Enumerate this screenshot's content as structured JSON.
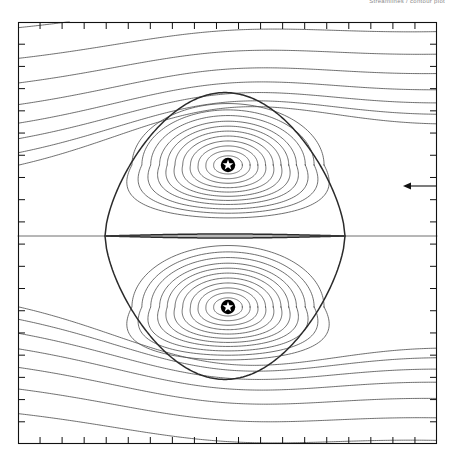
{
  "figure": {
    "top_note": "Streamlines / contour plot",
    "background": "#ffffff",
    "frame_color": "#111111",
    "line_color": "#4a4a4a",
    "separatrix_color": "#2b2b2b"
  },
  "axes": {
    "x_tick_count": 19,
    "y_tick_count": 19,
    "x_tick_labels": [],
    "y_tick_labels": [],
    "xlabel": "",
    "ylabel": "",
    "frame": {
      "left": 18,
      "top": 22,
      "right": 437,
      "bottom": 444
    }
  },
  "annotations": {
    "flow_arrow": {
      "name": "flow-direction-arrow",
      "direction": "left",
      "x_start": 437,
      "x_end": 403,
      "y": 186
    }
  },
  "chart_data": {
    "type": "line",
    "title": "",
    "subtitle": "",
    "xlabel": "",
    "ylabel": "",
    "xlim": [
      0,
      1
    ],
    "ylim": [
      0,
      1
    ],
    "grid": false,
    "legend": null,
    "critical_points": [
      {
        "type": "O-point",
        "label": "vortex-core-upper",
        "x": 228,
        "y": 165,
        "marker": "star-in-disc"
      },
      {
        "type": "O-point",
        "label": "vortex-core-lower",
        "x": 228,
        "y": 307,
        "marker": "star-in-disc"
      },
      {
        "type": "X-point",
        "label": "saddle-left",
        "x": 105,
        "y": 235,
        "marker": "none"
      },
      {
        "type": "X-point",
        "label": "saddle-right",
        "x": 345,
        "y": 235,
        "marker": "none"
      }
    ],
    "closed_contour_levels": [
      0.06,
      0.13,
      0.2,
      0.27,
      0.34,
      0.41,
      0.48,
      0.55,
      0.62,
      0.7,
      0.78,
      0.87
    ],
    "separatrix_level": 1.0,
    "open_contour_levels": [
      1.12,
      1.28,
      1.46,
      1.66,
      1.9,
      2.18,
      2.5,
      2.9
    ],
    "series": [
      {
        "name": "closed-streamlines-upper",
        "values": [
          0.06,
          0.13,
          0.2,
          0.27,
          0.34,
          0.41,
          0.48,
          0.55,
          0.62,
          0.7,
          0.78,
          0.87
        ]
      },
      {
        "name": "closed-streamlines-lower",
        "values": [
          0.06,
          0.13,
          0.2,
          0.27,
          0.34,
          0.41,
          0.48,
          0.55,
          0.62,
          0.7,
          0.78,
          0.87
        ]
      },
      {
        "name": "separatrix",
        "values": [
          1.0
        ]
      },
      {
        "name": "open-streamlines",
        "values": [
          1.12,
          1.28,
          1.46,
          1.66,
          1.9,
          2.18,
          2.5,
          2.9
        ]
      }
    ]
  }
}
